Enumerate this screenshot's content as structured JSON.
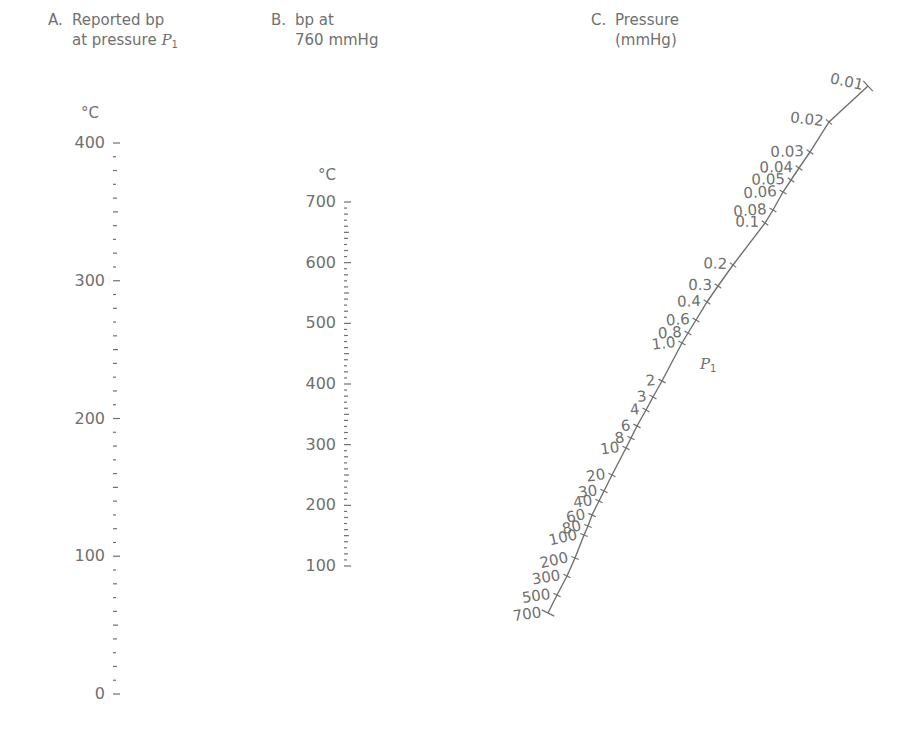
{
  "scales": {
    "a": {
      "letter": "A.",
      "title_line1": "Reported bp",
      "title_line2_prefix": "at pressure ",
      "title_var": "P",
      "title_sub": "1",
      "unit": "°C",
      "labels": [
        "400",
        "300",
        "200",
        "100",
        "0"
      ],
      "range": [
        0,
        400
      ],
      "minor_step": 10
    },
    "b": {
      "letter": "B.",
      "title_line1": "bp at",
      "title_line2": "760 mmHg",
      "unit": "°C",
      "labels": [
        "700",
        "600",
        "500",
        "400",
        "300",
        "200",
        "100"
      ],
      "range": [
        100,
        700
      ],
      "minor_step": 10
    },
    "c": {
      "letter": "C.",
      "title_line1": "Pressure",
      "title_line2": "(mmHg)",
      "marker_var": "P",
      "marker_sub": "1",
      "ticks": [
        {
          "label": "0.01",
          "x": 868,
          "y": 86
        },
        {
          "label": "0.02",
          "x": 829,
          "y": 122
        },
        {
          "label": "0.03",
          "x": 810,
          "y": 152
        },
        {
          "label": "0.04",
          "x": 799,
          "y": 168
        },
        {
          "label": "0.05",
          "x": 791,
          "y": 180
        },
        {
          "label": "0.06",
          "x": 783,
          "y": 192
        },
        {
          "label": "0.08",
          "x": 773,
          "y": 210
        },
        {
          "label": "0.1",
          "x": 765,
          "y": 223
        },
        {
          "label": "0.2",
          "x": 733,
          "y": 265
        },
        {
          "label": "0.3",
          "x": 718,
          "y": 286
        },
        {
          "label": "0.4",
          "x": 707,
          "y": 302
        },
        {
          "label": "0.6",
          "x": 696,
          "y": 320
        },
        {
          "label": "0.8",
          "x": 688,
          "y": 333
        },
        {
          "label": "1.0",
          "x": 682,
          "y": 343
        },
        {
          "label": "2",
          "x": 662,
          "y": 381
        },
        {
          "label": "3",
          "x": 653,
          "y": 397
        },
        {
          "label": "4",
          "x": 646,
          "y": 410
        },
        {
          "label": "6",
          "x": 637,
          "y": 426
        },
        {
          "label": "8",
          "x": 631,
          "y": 438
        },
        {
          "label": "10",
          "x": 626,
          "y": 448
        },
        {
          "label": "20",
          "x": 612,
          "y": 475
        },
        {
          "label": "30",
          "x": 604,
          "y": 491
        },
        {
          "label": "40",
          "x": 599,
          "y": 501
        },
        {
          "label": "60",
          "x": 592,
          "y": 515
        },
        {
          "label": "80",
          "x": 588,
          "y": 526
        },
        {
          "label": "100",
          "x": 584,
          "y": 535
        },
        {
          "label": "200",
          "x": 575,
          "y": 558
        },
        {
          "label": "300",
          "x": 567,
          "y": 576
        },
        {
          "label": "500",
          "x": 557,
          "y": 595
        },
        {
          "label": "700",
          "x": 548,
          "y": 613
        }
      ]
    }
  },
  "colors": {
    "ink": "#707070",
    "background": "#ffffff"
  }
}
